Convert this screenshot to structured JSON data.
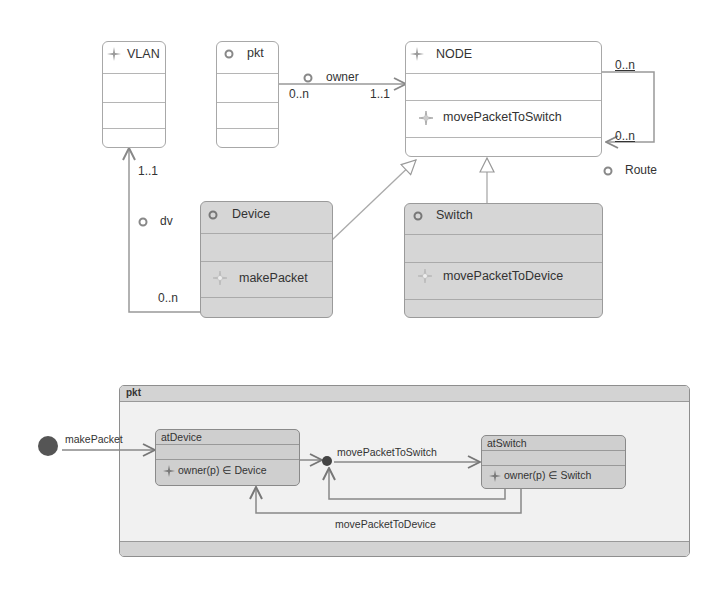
{
  "class_diagram": {
    "classes": [
      {
        "name": "VLAN",
        "icon": "sparkle-icon",
        "operations": []
      },
      {
        "name": "pkt",
        "icon": "circle-icon",
        "operations": []
      },
      {
        "name": "NODE",
        "icon": "sparkle-icon",
        "operations": [
          "movePacketToSwitch"
        ]
      },
      {
        "name": "Device",
        "icon": "circle-icon",
        "operations": [
          "makePacket"
        ]
      },
      {
        "name": "Switch",
        "icon": "circle-icon",
        "operations": [
          "movePacketToDevice"
        ]
      }
    ],
    "associations": {
      "owner": {
        "label": "owner",
        "source_mult": "0..n",
        "target_mult": "1..1"
      },
      "route": {
        "label": "Route",
        "source_mult": "0..n",
        "target_mult": "0..n"
      },
      "dv": {
        "label": "dv",
        "source_mult": "0..n",
        "target_mult": "1..1"
      }
    }
  },
  "state_diagram": {
    "frame_title": "pkt",
    "initial_transition": "makePacket",
    "states": [
      {
        "name": "atDevice",
        "invariant": "owner(p) ∈ Device"
      },
      {
        "name": "atSwitch",
        "invariant": "owner(p) ∈ Switch"
      }
    ],
    "transitions": {
      "to_switch": "movePacketToSwitch",
      "to_device": "movePacketToDevice"
    }
  },
  "colors": {
    "line": "#8c8c8c",
    "grey_fill": "#d6d6d6",
    "initial_node": "#555555"
  }
}
